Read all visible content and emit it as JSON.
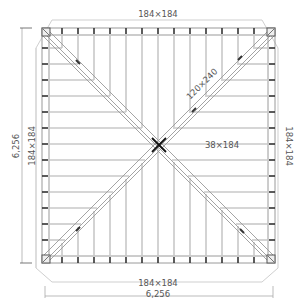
{
  "diagram": {
    "type": "hip-roof-framing-plan",
    "dimensions": {
      "top_beam": "184×184",
      "bottom_beam": "184×184",
      "left_beam": "184×184",
      "right_beam": "184×184",
      "overall_width": "6,256",
      "overall_height": "6,256"
    },
    "members": {
      "hip_rafter": "120×240",
      "jack_rafter": "38×184"
    },
    "colors": {
      "line": "#9a9a9a",
      "dark": "#222222",
      "text": "#555555"
    }
  }
}
